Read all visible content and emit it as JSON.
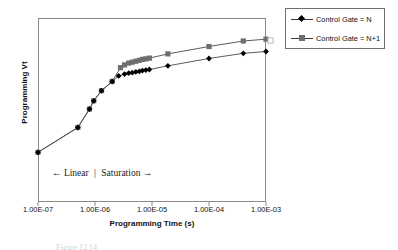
{
  "axes": {
    "y_title": "Programming Vt",
    "x_title": "Programming Time (s)",
    "x_ticks": [
      "1.00E-07",
      "1.00E-06",
      "1.00E-05",
      "1.00E-04",
      "1.00E-03"
    ]
  },
  "annotation": {
    "left_arrow": "←",
    "left_text": "Linear",
    "separator": "|",
    "right_text": "Saturation",
    "right_arrow": "→"
  },
  "legend": {
    "entries": [
      {
        "label": "Control Gate = N",
        "marker": "diamond",
        "color": "#000000"
      },
      {
        "label": "Control Gate = N+1",
        "marker": "square",
        "color": "#6e6e6e"
      }
    ]
  },
  "caption": "Figure  12.14",
  "chart_data": {
    "type": "line",
    "title": "",
    "xlabel": "Programming Time (s)",
    "ylabel": "Programming Vt",
    "xscale": "log",
    "xlim": [
      1e-07,
      0.001
    ],
    "ylim": [
      0,
      10
    ],
    "grid": false,
    "legend_position": "outside-top-right",
    "xticks": [
      1e-07,
      1e-06,
      1e-05,
      0.0001,
      0.001
    ],
    "xticklabels": [
      "1.00E-07",
      "1.00E-06",
      "1.00E-05",
      "1.00E-04",
      "1.00E-03"
    ],
    "yticklabels": [],
    "annotations": [
      {
        "text": "← Linear  | Saturation →",
        "x": 4.5e-07,
        "y": 1.55
      }
    ],
    "series": [
      {
        "name": "Control Gate = N+1",
        "marker": "square",
        "color": "#6e6e6e",
        "points": [
          [
            1e-07,
            2.7
          ],
          [
            5e-07,
            4.05
          ],
          [
            8e-07,
            5.05
          ],
          [
            9.5e-07,
            5.5
          ],
          [
            1.3e-06,
            6.05
          ],
          [
            2e-06,
            6.55
          ],
          [
            2.8e-06,
            7.3
          ],
          [
            3.3e-06,
            7.45
          ],
          [
            3.9e-06,
            7.55
          ],
          [
            4.5e-06,
            7.6
          ],
          [
            5.2e-06,
            7.65
          ],
          [
            6e-06,
            7.7
          ],
          [
            6.8e-06,
            7.75
          ],
          [
            7.8e-06,
            7.78
          ],
          [
            9e-06,
            7.82
          ],
          [
            1.9e-05,
            8.05
          ],
          [
            0.0001,
            8.45
          ],
          [
            0.0004,
            8.75
          ],
          [
            0.001,
            8.85
          ]
        ]
      },
      {
        "name": "Control Gate = N",
        "marker": "diamond",
        "color": "#000000",
        "points": [
          [
            1e-07,
            2.7
          ],
          [
            5e-07,
            4.05
          ],
          [
            8e-07,
            5.05
          ],
          [
            9.5e-07,
            5.5
          ],
          [
            1.3e-06,
            6.05
          ],
          [
            2e-06,
            6.55
          ],
          [
            2.6e-06,
            6.85
          ],
          [
            3.3e-06,
            6.95
          ],
          [
            3.9e-06,
            7.0
          ],
          [
            4.5e-06,
            7.03
          ],
          [
            5.2e-06,
            7.07
          ],
          [
            6e-06,
            7.1
          ],
          [
            6.8e-06,
            7.14
          ],
          [
            7.8e-06,
            7.17
          ],
          [
            9e-06,
            7.2
          ],
          [
            1.9e-05,
            7.4
          ],
          [
            0.0001,
            7.8
          ],
          [
            0.0004,
            8.08
          ],
          [
            0.001,
            8.18
          ]
        ]
      }
    ]
  }
}
